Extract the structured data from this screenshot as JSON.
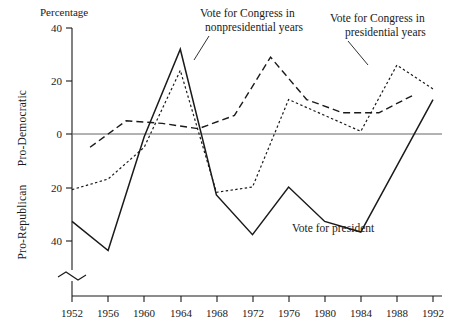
{
  "chart_data": {
    "type": "line",
    "title": "",
    "ylabel": "Percentage",
    "xlabel": "",
    "axis_top_label": "Percentage",
    "y_axis_upper_label": "Pro-Democratic",
    "y_axis_lower_label": "Pro-Republican",
    "yticks": [
      40,
      20,
      0,
      20,
      40
    ],
    "ytick_values": [
      40,
      20,
      0,
      -20,
      -40
    ],
    "ylim": [
      -48,
      40
    ],
    "xlim": [
      1952,
      1992
    ],
    "xticks": [
      1952,
      1956,
      1960,
      1964,
      1968,
      1972,
      1976,
      1980,
      1984,
      1988,
      1992
    ],
    "grid": false,
    "legend": "annotations",
    "zero_line": true,
    "axis_break": true,
    "series": [
      {
        "name": "Vote for president",
        "style": "solid",
        "x": [
          1952,
          1956,
          1960,
          1964,
          1968,
          1972,
          1976,
          1980,
          1984,
          1988,
          1992
        ],
        "values": [
          -33,
          -44,
          -1,
          32,
          -23,
          -38,
          -20,
          -33,
          -37,
          -12,
          13
        ]
      },
      {
        "name": "Vote for Congress in presidential years",
        "style": "dotted",
        "x": [
          1952,
          1956,
          1960,
          1964,
          1968,
          1972,
          1976,
          1980,
          1984,
          1988,
          1992
        ],
        "values": [
          -21,
          -17,
          -5,
          24,
          -22,
          -20,
          13,
          7,
          1,
          26,
          17
        ]
      },
      {
        "name": "Vote for Congress in nonpresidential years",
        "style": "dashed",
        "x": [
          1954,
          1958,
          1962,
          1966,
          1970,
          1974,
          1978,
          1982,
          1986,
          1990
        ],
        "values": [
          -5,
          5,
          4,
          2,
          7,
          29,
          13,
          8,
          8,
          15
        ]
      }
    ],
    "annotations": [
      {
        "id": "annot-nonpresidential",
        "lines": [
          "Vote for Congress in",
          "nonpresidential years"
        ],
        "x": 200,
        "y": 17
      },
      {
        "id": "annot-presidential",
        "lines": [
          "Vote for Congress in",
          "presidential years"
        ],
        "x": 330,
        "y": 22
      },
      {
        "id": "annot-president",
        "lines": [
          "Vote for president"
        ],
        "x": 292,
        "y": 232
      }
    ]
  }
}
